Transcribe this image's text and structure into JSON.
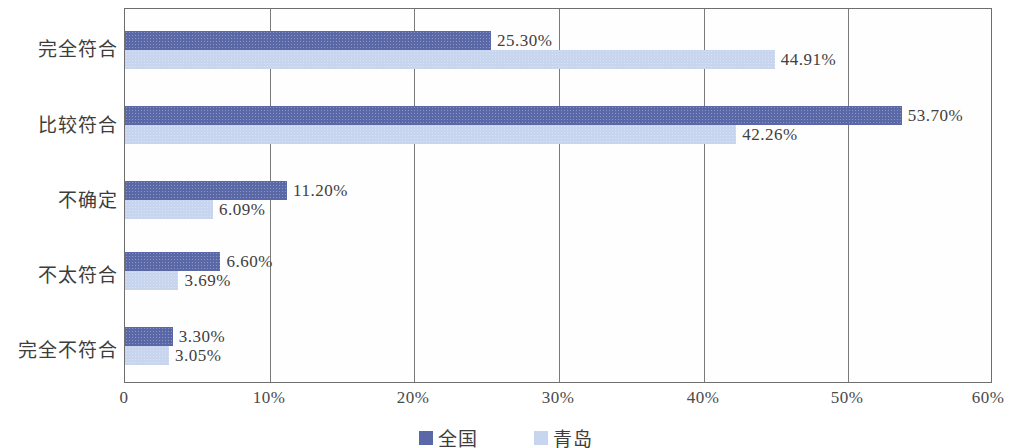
{
  "chart_data": {
    "type": "bar",
    "orientation": "horizontal",
    "title": "",
    "xlabel": "",
    "ylabel": "",
    "xlim": [
      0,
      60
    ],
    "xticks": [
      "0",
      "10%",
      "20%",
      "30%",
      "40%",
      "50%",
      "60%"
    ],
    "xtick_values": [
      0,
      10,
      20,
      30,
      40,
      50,
      60
    ],
    "grid": true,
    "legend_position": "bottom-center",
    "categories": [
      "完全符合",
      "比较符合",
      "不确定",
      "不太符合",
      "完全不符合"
    ],
    "series": [
      {
        "name": "全国",
        "color": "#5a68a8",
        "values": [
          25.3,
          53.7,
          11.2,
          6.6,
          3.3
        ],
        "labels": [
          "25.30%",
          "53.70%",
          "11.20%",
          "6.60%",
          "3.30%"
        ]
      },
      {
        "name": "青岛",
        "color": "#c7d5ef",
        "values": [
          44.91,
          42.26,
          6.09,
          3.69,
          3.05
        ],
        "labels": [
          "44.91%",
          "42.26%",
          "6.09%",
          "3.69%",
          "3.05%"
        ]
      }
    ]
  },
  "legend": {
    "items": [
      {
        "label": "全国",
        "color": "#5a68a8"
      },
      {
        "label": "青岛",
        "color": "#c7d5ef"
      }
    ]
  }
}
